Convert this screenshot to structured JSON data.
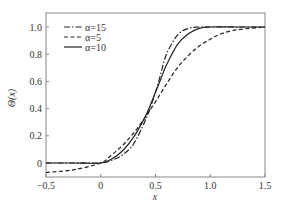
{
  "chart_data": {
    "type": "line",
    "title": "",
    "xlabel": "x",
    "ylabel": "Θ(x)",
    "xlim": [
      -0.5,
      1.5
    ],
    "ylim": [
      -0.1,
      1.08
    ],
    "xticks": [
      -0.5,
      0,
      0.5,
      1.0,
      1.5
    ],
    "xtick_labels": [
      "−0.5",
      "0",
      "0.5",
      "1.0",
      "1.5"
    ],
    "yticks": [
      0,
      0.2,
      0.4,
      0.6,
      0.8,
      1.0
    ],
    "ytick_labels": [
      "0",
      "0.2",
      "0.4",
      "0.6",
      "0.8",
      "1.0"
    ],
    "grid": false,
    "legend_position": "top-left",
    "series": [
      {
        "name": "α=15",
        "style": "dash-dot",
        "x": [
          -0.5,
          -0.25,
          0,
          0.1,
          0.2,
          0.3,
          0.4,
          0.45,
          0.5,
          0.55,
          0.6,
          0.7,
          0.8,
          0.9,
          1.0,
          1.25,
          1.5
        ],
        "y": [
          0,
          0,
          0,
          0.02,
          0.06,
          0.14,
          0.3,
          0.4,
          0.52,
          0.66,
          0.8,
          0.94,
          0.99,
          1.0,
          1.0,
          1.0,
          1.0
        ]
      },
      {
        "name": "α=5",
        "style": "dashed",
        "x": [
          -0.5,
          -0.25,
          0,
          0.1,
          0.2,
          0.3,
          0.4,
          0.5,
          0.6,
          0.7,
          0.8,
          0.9,
          1.0,
          1.1,
          1.25,
          1.5
        ],
        "y": [
          -0.07,
          -0.05,
          0,
          0.06,
          0.13,
          0.22,
          0.33,
          0.45,
          0.58,
          0.7,
          0.79,
          0.86,
          0.91,
          0.95,
          0.98,
          1.0
        ]
      },
      {
        "name": "α=10",
        "style": "solid",
        "x": [
          -0.5,
          -0.25,
          0,
          0.1,
          0.2,
          0.3,
          0.4,
          0.45,
          0.5,
          0.55,
          0.6,
          0.7,
          0.8,
          0.9,
          1.0,
          1.25,
          1.5
        ],
        "y": [
          0,
          0,
          0,
          0.03,
          0.09,
          0.19,
          0.33,
          0.42,
          0.52,
          0.62,
          0.72,
          0.87,
          0.95,
          0.99,
          1.0,
          1.0,
          1.0
        ]
      }
    ]
  }
}
